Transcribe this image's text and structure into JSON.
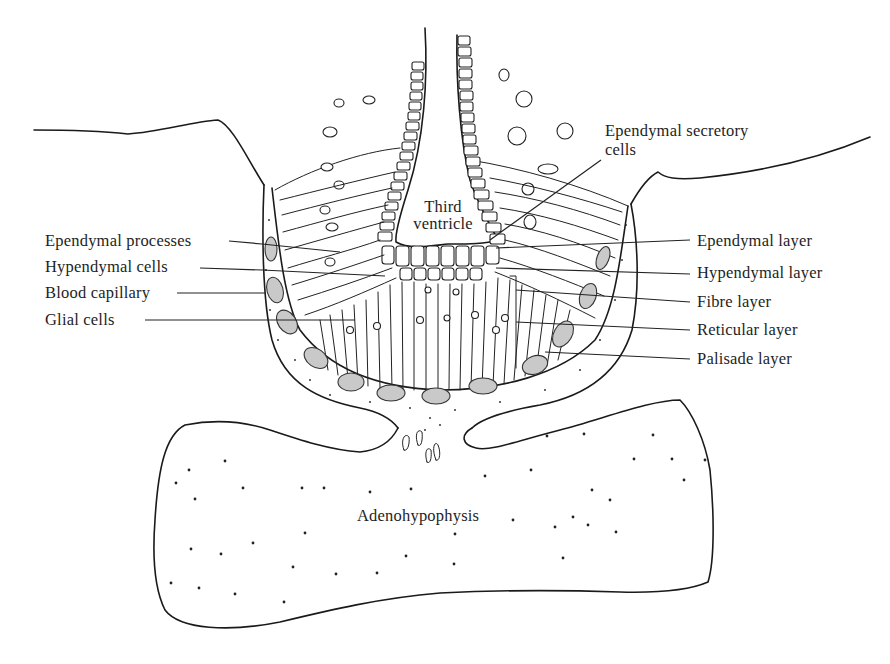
{
  "figure": {
    "title": "",
    "colors": {
      "line": "#1a1a1a",
      "capillary_fill": "#c9c9c9",
      "background": "#ffffff"
    }
  },
  "labels": {
    "left": [
      {
        "id": "ependymal-processes",
        "text": "Ependymal processes"
      },
      {
        "id": "hypendymal-cells",
        "text": "Hypendymal cells"
      },
      {
        "id": "blood-capillary",
        "text": "Blood capillary"
      },
      {
        "id": "glial-cells",
        "text": "Glial cells"
      }
    ],
    "right": [
      {
        "id": "ependymal-secretory-cells",
        "line1": "Ependymal secretory",
        "line2": "cells"
      },
      {
        "id": "ependymal-layer",
        "text": "Ependymal layer"
      },
      {
        "id": "hypendymal-layer",
        "text": "Hypendymal layer"
      },
      {
        "id": "fibre-layer",
        "text": "Fibre layer"
      },
      {
        "id": "reticular-layer",
        "text": "Reticular layer"
      },
      {
        "id": "palisade-layer",
        "text": "Palisade layer"
      }
    ],
    "center": {
      "third_ventricle_line1": "Third",
      "third_ventricle_line2": "ventricle",
      "adenohypophysis": "Adenohypophysis"
    }
  }
}
